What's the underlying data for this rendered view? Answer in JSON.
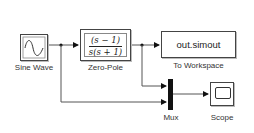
{
  "blocks": {
    "sine_wave": {
      "label": "Sine Wave"
    },
    "zero_pole": {
      "label": "Zero-Pole",
      "numerator": "(s − 1)",
      "denominator": "s(s + 1)"
    },
    "to_workspace": {
      "label": "To Workspace",
      "variable": "out.simout"
    },
    "mux": {
      "label": "Mux"
    },
    "scope": {
      "label": "Scope"
    }
  },
  "colors": {
    "line": "#555555",
    "block_border": "#444444",
    "mux_fill": "#111111"
  }
}
